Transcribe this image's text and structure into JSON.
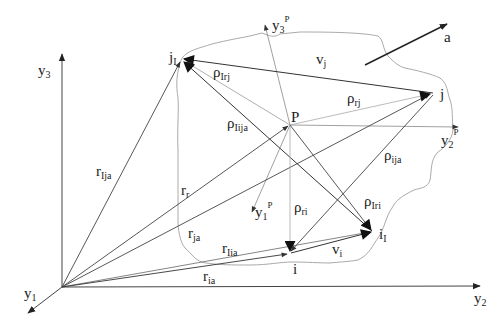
{
  "diagram": {
    "type": "vector-kinematics-diagram",
    "colors": {
      "line_dark": "#333333",
      "line_light": "#999999",
      "body_outline": "#aaaaaa",
      "text": "#222222"
    },
    "global_axes": {
      "y1": {
        "base": "y",
        "sub": "1"
      },
      "y2": {
        "base": "y",
        "sub": "2"
      },
      "y3": {
        "base": "y",
        "sub": "3"
      }
    },
    "local_axes": {
      "y1P": {
        "base": "y",
        "sub": "1",
        "sup": "P"
      },
      "y2P": {
        "base": "y",
        "sub": "2",
        "sup": "P"
      },
      "y3P": {
        "base": "y",
        "sub": "3",
        "sup": "P"
      }
    },
    "points": {
      "j1": {
        "base": "j",
        "sub": "I"
      },
      "j": {
        "base": "j"
      },
      "P": {
        "base": "P"
      },
      "i": {
        "base": "i"
      },
      "i1": {
        "base": "i",
        "sub": "I"
      }
    },
    "vectors": {
      "rIja": {
        "base": "r",
        "sub": "Ija"
      },
      "rr": {
        "base": "r",
        "sub": "r"
      },
      "rja": {
        "base": "r",
        "sub": "ja"
      },
      "rIia": {
        "base": "r",
        "sub": "Iia"
      },
      "ria": {
        "base": "r",
        "sub": "ia"
      },
      "rhoIrj": {
        "base": "ρ",
        "sub": "Irj"
      },
      "rhoIija": {
        "base": "ρ",
        "sub": "Iija"
      },
      "rhorj": {
        "base": "ρ",
        "sub": "rj"
      },
      "rhoija": {
        "base": "ρ",
        "sub": "ija"
      },
      "rhori": {
        "base": "ρ",
        "sub": "ri"
      },
      "rhoIri": {
        "base": "ρ",
        "sub": "Iri"
      },
      "vj": {
        "base": "v",
        "sub": "j"
      },
      "vi": {
        "base": "v",
        "sub": "i"
      },
      "a": {
        "base": "a"
      }
    }
  }
}
